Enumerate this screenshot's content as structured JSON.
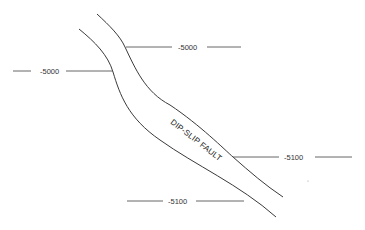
{
  "diagram": {
    "fault_label": "DIP-SLIP FAULT",
    "contours": [
      {
        "id": "left-5000",
        "label": "-5000"
      },
      {
        "id": "top-5000",
        "label": "-5000"
      },
      {
        "id": "right-5100",
        "label": "-5100"
      },
      {
        "id": "bottom-5100",
        "label": "-5100"
      }
    ],
    "colors": {
      "line": "#555555",
      "fault": "#3a3a3a",
      "text": "#333333"
    }
  }
}
